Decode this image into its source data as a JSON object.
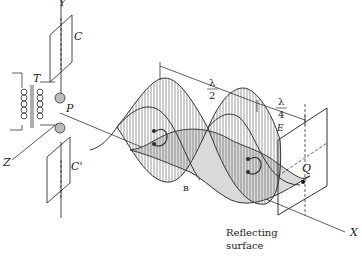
{
  "labels": {
    "y_axis": "Y",
    "x_axis": "X",
    "z_axis": "Z",
    "plate_top": "C",
    "plate_bottom": "C'",
    "transformer": "T",
    "spark_gap": "P",
    "point_q": "Q",
    "e_field": "E",
    "b_field": "B",
    "lambda": "λ",
    "half_den": "2",
    "quarter_den": "4",
    "reflecting_line1": "Reflecting",
    "reflecting_line2": "surface"
  },
  "colors": {
    "ink": "#333333",
    "shade": "#d9d9d9",
    "background": "#ffffff"
  }
}
